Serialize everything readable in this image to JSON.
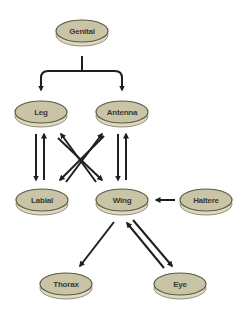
{
  "diagram": {
    "colors": {
      "node_fill": "#c9c4a6",
      "node_rim": "#ddd9c2",
      "node_stroke": "#5b5a44",
      "arrow": "#1f1f1f",
      "background": "#ffffff"
    },
    "nodes": {
      "genital": {
        "label": "Genital"
      },
      "leg": {
        "label": "Leg"
      },
      "antenna": {
        "label": "Antenna"
      },
      "labial": {
        "label": "Labial"
      },
      "wing": {
        "label": "Wing"
      },
      "haltere": {
        "label": "Haltere"
      },
      "thorax": {
        "label": "Thorax"
      },
      "eye": {
        "label": "Eye"
      }
    },
    "edges": [
      {
        "from": "Genital",
        "to": "Leg"
      },
      {
        "from": "Genital",
        "to": "Antenna"
      },
      {
        "from": "Leg",
        "to": "Labial"
      },
      {
        "from": "Labial",
        "to": "Leg"
      },
      {
        "from": "Antenna",
        "to": "Wing"
      },
      {
        "from": "Wing",
        "to": "Antenna"
      },
      {
        "from": "Leg",
        "to": "Wing"
      },
      {
        "from": "Wing",
        "to": "Leg"
      },
      {
        "from": "Antenna",
        "to": "Labial"
      },
      {
        "from": "Labial",
        "to": "Antenna"
      },
      {
        "from": "Haltere",
        "to": "Wing"
      },
      {
        "from": "Wing",
        "to": "Thorax"
      },
      {
        "from": "Wing",
        "to": "Eye"
      },
      {
        "from": "Eye",
        "to": "Wing"
      }
    ]
  }
}
